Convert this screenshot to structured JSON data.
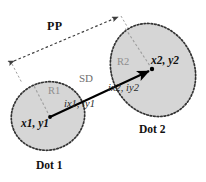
{
  "diagram": {
    "colors": {
      "dot_fill": "#d6d6d6",
      "dot_outline": "#3a3a3a",
      "sd_line": "#000000",
      "pp_line": "#4a4a4a",
      "radius_line": "#9a9a9a",
      "radius_label": "#8e8e8e",
      "background": "#ffffff"
    },
    "shapes": [
      {
        "name": "dot-1-ellipse",
        "cx": 48,
        "cy": 116,
        "rx": 37,
        "ry": 34,
        "rotate": -18
      },
      {
        "name": "dot-2-ellipse",
        "cx": 153,
        "cy": 70,
        "rx": 41,
        "ry": 48,
        "rotate": -28
      }
    ],
    "labels": {
      "pp": "PP",
      "sd": "SD",
      "r1": "R1",
      "r2": "R2",
      "center1": "x1, y1",
      "center2": "x2, y2",
      "intersect1": "ix1, iy1",
      "intersect2": "ix2, iy2",
      "dot1": "Dot 1",
      "dot2": "Dot 2"
    },
    "points": {
      "center1": {
        "x": 50,
        "y": 117
      },
      "center2": {
        "x": 152,
        "y": 69
      },
      "intersect1": {
        "x": 79,
        "y": 103
      },
      "intersect2": {
        "x": 118,
        "y": 85
      },
      "pp_start": {
        "x": 11,
        "y": 63
      },
      "pp_end": {
        "x": 121,
        "y": 15
      },
      "r1_end": {
        "x": 33,
        "y": 84
      },
      "r2_end": {
        "x": 125,
        "y": 28
      }
    }
  }
}
